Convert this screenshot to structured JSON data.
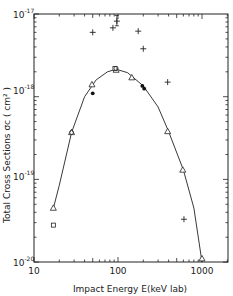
{
  "chart_data": {
    "type": "scatter",
    "title": "",
    "xlabel": "Impact   Energy  E(keV lab)",
    "ylabel": "Total  Cross  Sections  σc  ( cm² )",
    "xscale": "log",
    "yscale": "log",
    "xlim": [
      10,
      2000
    ],
    "ylim": [
      1e-20,
      1e-17
    ],
    "grid": false,
    "legend": null,
    "x_ticks": [
      {
        "value": 10,
        "label": "10"
      },
      {
        "value": 100,
        "label": "100"
      },
      {
        "value": 1000,
        "label": "1000"
      }
    ],
    "y_ticks": [
      {
        "value": 1e-17,
        "base": "10",
        "exp": "-17"
      },
      {
        "value": 1e-18,
        "base": "10",
        "exp": "-18"
      },
      {
        "value": 1e-19,
        "base": "10",
        "exp": "-19"
      },
      {
        "value": 1e-20,
        "base": "10",
        "exp": "-20"
      }
    ],
    "series": [
      {
        "name": "open triangles",
        "marker": "triangle-open",
        "points": [
          {
            "x": 17,
            "y": 4.5e-20
          },
          {
            "x": 28,
            "y": 3.7e-19
          },
          {
            "x": 49,
            "y": 1.4e-18
          },
          {
            "x": 95,
            "y": 2.1e-18
          },
          {
            "x": 146,
            "y": 1.7e-18
          },
          {
            "x": 390,
            "y": 3.8e-19
          },
          {
            "x": 590,
            "y": 1.3e-19
          },
          {
            "x": 1000,
            "y": 1.1e-20
          }
        ]
      },
      {
        "name": "open squares",
        "marker": "square-open",
        "points": [
          {
            "x": 17,
            "y": 2.8e-20
          },
          {
            "x": 92,
            "y": 2.2e-18
          }
        ]
      },
      {
        "name": "open circles",
        "marker": "circle-open",
        "points": [
          {
            "x": 28,
            "y": 3.7e-19
          },
          {
            "x": 95,
            "y": 2.2e-18
          }
        ]
      },
      {
        "name": "filled circles",
        "marker": "circle-filled",
        "points": [
          {
            "x": 50,
            "y": 1.1e-18
          },
          {
            "x": 195,
            "y": 1.35e-18
          },
          {
            "x": 205,
            "y": 1.25e-18
          }
        ]
      },
      {
        "name": "crosses",
        "marker": "plus",
        "points": [
          {
            "x": 50,
            "y": 6e-18
          },
          {
            "x": 87,
            "y": 6.8e-18
          },
          {
            "x": 97,
            "y": 8.2e-18,
            "yerr": [
              7.2e-18,
              9.6e-18
            ]
          },
          {
            "x": 174,
            "y": 6.2e-18
          },
          {
            "x": 200,
            "y": 3.8e-18
          },
          {
            "x": 390,
            "y": 1.5e-18
          },
          {
            "x": 610,
            "y": 3.3e-20
          }
        ]
      },
      {
        "name": "fit curve",
        "marker": "line",
        "points": [
          {
            "x": 17,
            "y": 4.5e-20
          },
          {
            "x": 20,
            "y": 8.5e-20
          },
          {
            "x": 28,
            "y": 3.7e-19
          },
          {
            "x": 40,
            "y": 1e-18
          },
          {
            "x": 55,
            "y": 1.6e-18
          },
          {
            "x": 75,
            "y": 2e-18
          },
          {
            "x": 95,
            "y": 2.15e-18
          },
          {
            "x": 130,
            "y": 1.95e-18
          },
          {
            "x": 200,
            "y": 1.35e-18
          },
          {
            "x": 300,
            "y": 7.5e-19
          },
          {
            "x": 400,
            "y": 3.8e-19
          },
          {
            "x": 600,
            "y": 1.3e-19
          },
          {
            "x": 800,
            "y": 4.5e-20
          },
          {
            "x": 1000,
            "y": 1e-20
          }
        ]
      }
    ]
  },
  "axes": {
    "x_title": "Impact   Energy  E(keV lab)",
    "y_title": "Total  Cross  Sections  σc  ( cm² )",
    "x_tick_10": "10",
    "x_tick_100": "100",
    "x_tick_1000": "1000",
    "y_base": "10",
    "y_exp_17": "-17",
    "y_exp_18": "-18",
    "y_exp_19": "-19",
    "y_exp_20": "-20"
  }
}
